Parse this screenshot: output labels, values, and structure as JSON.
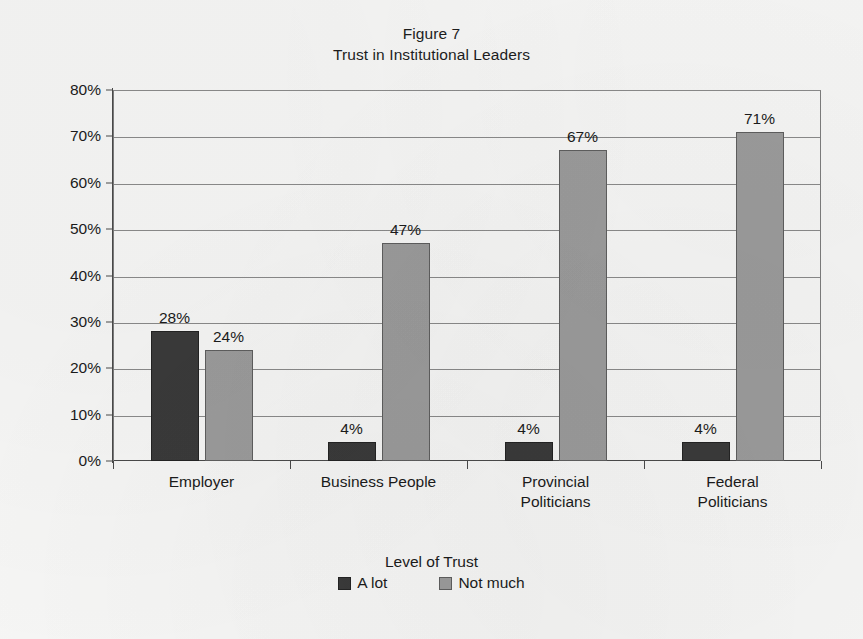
{
  "figure": {
    "title_line1": "Figure 7",
    "title_line2": "Trust in Institutional Leaders"
  },
  "axis": {
    "x_axis_title": "Level of Trust",
    "y_ticks": [
      "80%",
      "70%",
      "60%",
      "50%",
      "40%",
      "30%",
      "20%",
      "10%",
      "0%"
    ]
  },
  "legend": {
    "items": [
      {
        "label": "A lot",
        "color": "#3a3a3a"
      },
      {
        "label": "Not much",
        "color": "#9b9b9b"
      }
    ]
  },
  "bar_labels": {
    "g0s0": "28%",
    "g0s1": "24%",
    "g1s0": "4%",
    "g1s1": "47%",
    "g2s0": "4%",
    "g2s1": "67%",
    "g3s0": "4%",
    "g3s1": "71%"
  },
  "categories_display": {
    "c0": "Employer",
    "c1": "Business  People",
    "c2": "Provincial\nPoliticians",
    "c3": "Federal Politicians"
  },
  "chart_data": {
    "type": "bar",
    "xlabel": "Level of Trust",
    "ylabel": "",
    "ylim": [
      0,
      80
    ],
    "ytick_values": [
      0,
      10,
      20,
      30,
      40,
      50,
      60,
      70,
      80
    ],
    "ytick_labels": [
      "0%",
      "10%",
      "20%",
      "30%",
      "40%",
      "50%",
      "60%",
      "70%",
      "80%"
    ],
    "grid": true,
    "legend_position": "bottom",
    "categories": [
      "Employer",
      "Business People",
      "Provincial Politicians",
      "Federal Politicians"
    ],
    "series": [
      {
        "name": "A lot",
        "color": "#3a3a3a",
        "values": [
          28,
          4,
          4,
          4
        ],
        "labels": [
          "28%",
          "4%",
          "4%",
          "4%"
        ]
      },
      {
        "name": "Not much",
        "color": "#9b9b9b",
        "values": [
          24,
          47,
          67,
          71
        ],
        "labels": [
          "24%",
          "47%",
          "67%",
          "71%"
        ]
      }
    ]
  }
}
